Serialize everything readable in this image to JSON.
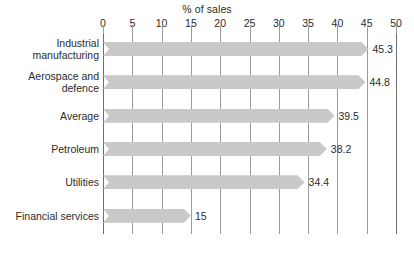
{
  "chart_data": {
    "type": "bar",
    "orientation": "horizontal",
    "title": "% of sales",
    "xlabel": "% of sales",
    "ylabel": "",
    "xlim": [
      0,
      50
    ],
    "xticks": [
      0,
      5,
      10,
      15,
      20,
      25,
      30,
      35,
      40,
      45,
      50
    ],
    "xtick_labels": [
      "0",
      "5",
      "10",
      "15",
      "20",
      "25",
      "30",
      "35",
      "40",
      "45",
      "50"
    ],
    "grid": true,
    "legend": false,
    "bar_color": "#c9c9c9",
    "categories": [
      "Industrial\nmanufacturing",
      "Aerospace and\ndefence",
      "Average",
      "Petroleum",
      "Utilities",
      "Financial services"
    ],
    "values": [
      45.3,
      44.8,
      39.5,
      38.2,
      34.4,
      15
    ],
    "value_labels": [
      "45.3",
      "44.8",
      "39.5",
      "38.2",
      "34.4",
      "15"
    ]
  }
}
